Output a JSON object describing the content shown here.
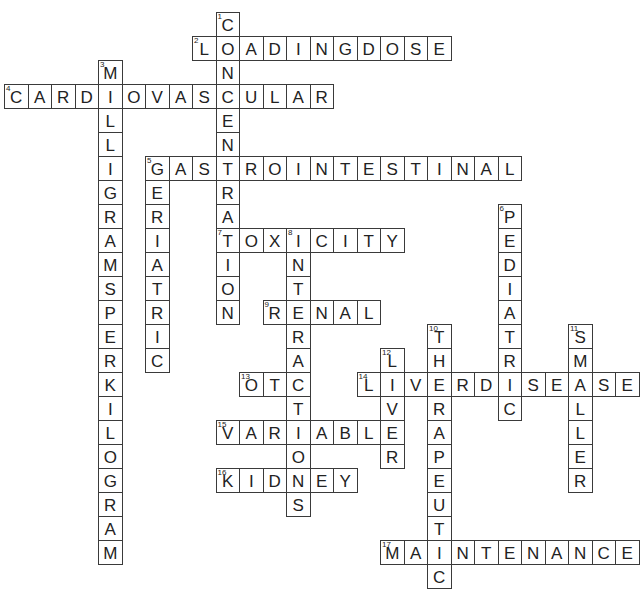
{
  "puzzle": {
    "type": "crossword",
    "grid": {
      "origin_x": 4,
      "origin_y": 12,
      "cell_w": 23.5,
      "cell_h": 24
    },
    "colors": {
      "line": "#3a3a3a",
      "text": "#222222",
      "background": "#ffffff"
    },
    "words": [
      {
        "number": 1,
        "direction": "down",
        "row": 0,
        "col": 9,
        "answer": "CONCENTRATION"
      },
      {
        "number": 2,
        "direction": "across",
        "row": 1,
        "col": 8,
        "answer": "LOADINGDOSE"
      },
      {
        "number": 3,
        "direction": "down",
        "row": 2,
        "col": 4,
        "answer": "MILLIGRAMSPERKILOGRAM"
      },
      {
        "number": 4,
        "direction": "across",
        "row": 3,
        "col": 0,
        "answer": "CARDIOVASCULAR"
      },
      {
        "number": 5,
        "direction": "across",
        "row": 6,
        "col": 6,
        "answer": "GASTROINTESTINAL"
      },
      {
        "number": 5,
        "direction": "down",
        "row": 6,
        "col": 6,
        "answer": "GERIATRIC"
      },
      {
        "number": 6,
        "direction": "down",
        "row": 8,
        "col": 21,
        "answer": "PEDIATRIC"
      },
      {
        "number": 7,
        "direction": "across",
        "row": 9,
        "col": 9,
        "answer": "TOXICITY"
      },
      {
        "number": 8,
        "direction": "down",
        "row": 9,
        "col": 12,
        "answer": "INTERACTIONS"
      },
      {
        "number": 9,
        "direction": "across",
        "row": 12,
        "col": 11,
        "answer": "RENAL"
      },
      {
        "number": 10,
        "direction": "down",
        "row": 13,
        "col": 18,
        "answer": "THERAPEUTIC"
      },
      {
        "number": 11,
        "direction": "down",
        "row": 13,
        "col": 24,
        "answer": "SMALLER"
      },
      {
        "number": 12,
        "direction": "down",
        "row": 14,
        "col": 16,
        "answer": "LIVER"
      },
      {
        "number": 13,
        "direction": "across",
        "row": 15,
        "col": 10,
        "answer": "OTC"
      },
      {
        "number": 14,
        "direction": "across",
        "row": 15,
        "col": 15,
        "answer": "LIVERDISEASE"
      },
      {
        "number": 15,
        "direction": "across",
        "row": 17,
        "col": 9,
        "answer": "VARIABLE"
      },
      {
        "number": 16,
        "direction": "across",
        "row": 19,
        "col": 9,
        "answer": "KIDNEY"
      },
      {
        "number": 17,
        "direction": "across",
        "row": 22,
        "col": 16,
        "answer": "MAINTENANCE"
      }
    ]
  }
}
